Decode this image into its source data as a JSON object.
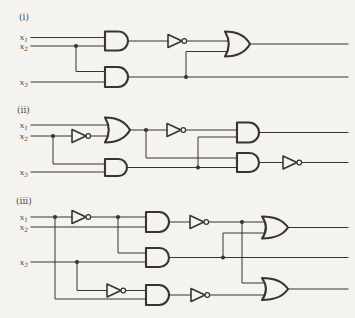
{
  "page": {
    "width": 355,
    "height": 318,
    "background_color": "#f4f3ef",
    "ink_color": "#38352f",
    "label_color": "#4c473f"
  },
  "figure": {
    "description_labels": [
      "(i)",
      "(ii)",
      "(iii)"
    ],
    "input_names": [
      "x1",
      "x2",
      "x3"
    ]
  },
  "circuits": [
    {
      "id": "i",
      "label": "(i)",
      "label_pos": [
        19,
        20
      ],
      "input_labels": [
        {
          "base": "x",
          "sub": "1",
          "x": 28,
          "y": 40
        },
        {
          "base": "x",
          "sub": "2",
          "x": 28,
          "y": 48.8
        },
        {
          "base": "x",
          "sub": "3",
          "x": 28,
          "y": 84.8
        }
      ],
      "wires": [
        [
          [
            31,
            37.5
          ],
          [
            107,
            37.5
          ]
        ],
        [
          [
            31,
            46
          ],
          [
            107,
            46
          ]
        ],
        [
          [
            76,
            46
          ],
          [
            76,
            71.5
          ],
          [
            107,
            71.5
          ]
        ],
        [
          [
            31,
            82
          ],
          [
            107,
            82
          ]
        ],
        [
          [
            128,
            41
          ],
          [
            168,
            41
          ]
        ],
        [
          [
            186.6,
            41
          ],
          [
            230,
            41
          ]
        ],
        [
          [
            128,
            77
          ],
          [
            348,
            77
          ]
        ],
        [
          [
            186,
            77
          ],
          [
            186,
            51.5
          ],
          [
            230,
            51.5
          ]
        ],
        [
          [
            250,
            44
          ],
          [
            348,
            44
          ]
        ]
      ],
      "dots": [
        [
          76,
          46
        ],
        [
          186,
          77
        ]
      ],
      "gates": [
        {
          "type": "and",
          "x": 105,
          "y": 31.5,
          "w": 23,
          "h": 19
        },
        {
          "type": "and",
          "x": 105,
          "y": 67,
          "w": 23,
          "h": 20
        },
        {
          "type": "not",
          "x": 168,
          "cy": 41,
          "w": 14,
          "h": 13
        },
        {
          "type": "or",
          "x": 225,
          "y": 31.5,
          "w": 25,
          "h": 25
        }
      ]
    },
    {
      "id": "ii",
      "label": "(ii)",
      "label_pos": [
        17,
        113
      ],
      "input_labels": [
        {
          "base": "x",
          "sub": "1",
          "x": 28,
          "y": 127.8
        },
        {
          "base": "x",
          "sub": "2",
          "x": 28,
          "y": 138.8
        },
        {
          "base": "x",
          "sub": "3",
          "x": 28,
          "y": 174.8
        }
      ],
      "wires": [
        [
          [
            31,
            125
          ],
          [
            111,
            125
          ]
        ],
        [
          [
            31,
            136
          ],
          [
            72,
            136
          ]
        ],
        [
          [
            90.6,
            136
          ],
          [
            111,
            136
          ]
        ],
        [
          [
            53,
            136
          ],
          [
            53,
            164
          ],
          [
            107,
            164
          ]
        ],
        [
          [
            31,
            172
          ],
          [
            107,
            172
          ]
        ],
        [
          [
            130,
            130
          ],
          [
            167,
            130
          ]
        ],
        [
          [
            185.6,
            130
          ],
          [
            238,
            130
          ]
        ],
        [
          [
            146,
            130
          ],
          [
            146,
            158
          ],
          [
            238,
            158
          ]
        ],
        [
          [
            127,
            167.5
          ],
          [
            238,
            167.5
          ]
        ],
        [
          [
            198,
            167.5
          ],
          [
            198,
            137
          ],
          [
            238,
            137
          ]
        ],
        [
          [
            259,
            132.5
          ],
          [
            348,
            132.5
          ]
        ],
        [
          [
            259,
            162.5
          ],
          [
            283,
            162.5
          ]
        ],
        [
          [
            301.6,
            162.5
          ],
          [
            348,
            162.5
          ]
        ]
      ],
      "dots": [
        [
          53,
          136
        ],
        [
          146,
          130
        ],
        [
          198,
          167.5
        ]
      ],
      "gates": [
        {
          "type": "not",
          "x": 72,
          "cy": 136,
          "w": 14,
          "h": 13
        },
        {
          "type": "or",
          "x": 105,
          "y": 117.5,
          "w": 25,
          "h": 25
        },
        {
          "type": "and",
          "x": 105,
          "y": 159,
          "w": 22,
          "h": 17
        },
        {
          "type": "not",
          "x": 167,
          "cy": 130,
          "w": 14,
          "h": 13
        },
        {
          "type": "and",
          "x": 237,
          "y": 122.5,
          "w": 22,
          "h": 20
        },
        {
          "type": "and",
          "x": 237,
          "y": 153,
          "w": 22,
          "h": 19
        },
        {
          "type": "not",
          "x": 283,
          "cy": 162.5,
          "w": 14,
          "h": 13
        }
      ]
    },
    {
      "id": "iii",
      "label": "(iii)",
      "label_pos": [
        16,
        203.5
      ],
      "input_labels": [
        {
          "base": "x",
          "sub": "1",
          "x": 28,
          "y": 219.8
        },
        {
          "base": "x",
          "sub": "2",
          "x": 28,
          "y": 229.8
        },
        {
          "base": "x",
          "sub": "3",
          "x": 28,
          "y": 264.8
        }
      ],
      "wires": [
        [
          [
            31,
            217
          ],
          [
            72,
            217
          ]
        ],
        [
          [
            90.6,
            217
          ],
          [
            147,
            217
          ]
        ],
        [
          [
            31,
            227
          ],
          [
            147,
            227
          ]
        ],
        [
          [
            55,
            217
          ],
          [
            55,
            299
          ],
          [
            147,
            299
          ]
        ],
        [
          [
            118,
            217
          ],
          [
            118,
            253
          ],
          [
            147,
            253
          ]
        ],
        [
          [
            31,
            262
          ],
          [
            147,
            262
          ]
        ],
        [
          [
            77,
            262
          ],
          [
            77,
            290.5
          ],
          [
            107,
            290.5
          ]
        ],
        [
          [
            125.6,
            290.5
          ],
          [
            147,
            290.5
          ]
        ],
        [
          [
            169,
            222
          ],
          [
            190,
            222
          ]
        ],
        [
          [
            208.6,
            222
          ],
          [
            267,
            222
          ]
        ],
        [
          [
            242,
            222
          ],
          [
            242,
            283
          ],
          [
            267,
            283
          ]
        ],
        [
          [
            169,
            257.5
          ],
          [
            348,
            257.5
          ]
        ],
        [
          [
            223,
            257.5
          ],
          [
            223,
            233
          ],
          [
            267,
            233
          ]
        ],
        [
          [
            169,
            295
          ],
          [
            191,
            295
          ]
        ],
        [
          [
            209.6,
            295
          ],
          [
            267,
            295
          ]
        ],
        [
          [
            288,
            227.5
          ],
          [
            348,
            227.5
          ]
        ],
        [
          [
            288,
            289
          ],
          [
            348,
            289
          ]
        ]
      ],
      "dots": [
        [
          55,
          217
        ],
        [
          118,
          217
        ],
        [
          77,
          262
        ],
        [
          242,
          222
        ],
        [
          223,
          257.5
        ]
      ],
      "gates": [
        {
          "type": "not",
          "x": 72,
          "cy": 217,
          "w": 14,
          "h": 13
        },
        {
          "type": "and",
          "x": 146,
          "y": 212,
          "w": 23,
          "h": 20
        },
        {
          "type": "not",
          "x": 190,
          "cy": 222,
          "w": 14,
          "h": 13
        },
        {
          "type": "and",
          "x": 146,
          "y": 248,
          "w": 23,
          "h": 19
        },
        {
          "type": "not",
          "x": 107,
          "cy": 290.5,
          "w": 14,
          "h": 13
        },
        {
          "type": "and",
          "x": 146,
          "y": 285,
          "w": 23,
          "h": 20
        },
        {
          "type": "not",
          "x": 191,
          "cy": 295,
          "w": 14,
          "h": 13
        },
        {
          "type": "or",
          "x": 262,
          "y": 216.5,
          "w": 26,
          "h": 22
        },
        {
          "type": "or",
          "x": 262,
          "y": 278,
          "w": 26,
          "h": 22
        }
      ]
    }
  ]
}
